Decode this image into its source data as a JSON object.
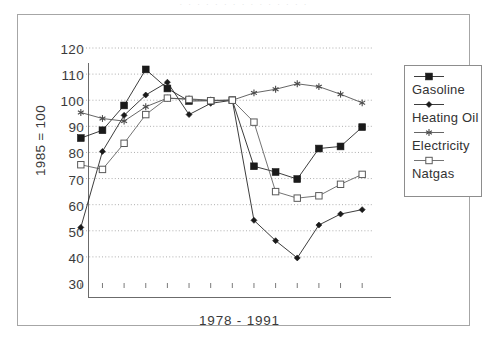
{
  "figure": {
    "scan_artifact_text": "· · · · · · · · · · · · · · ·"
  },
  "chart_data": {
    "type": "line",
    "title": "",
    "subtitle": "",
    "xlabel": "1978 - 1991",
    "ylabel": "1985 = 100",
    "x": [
      1978,
      1979,
      1980,
      1981,
      1982,
      1983,
      1984,
      1985,
      1986,
      1987,
      1988,
      1989,
      1990,
      1991
    ],
    "x_tick_labels": [
      "",
      "",
      "",
      "",
      "",
      "",
      "",
      "",
      "",
      "",
      "",
      "",
      "",
      ""
    ],
    "ylim": [
      30,
      120
    ],
    "y_ticks": [
      30,
      40,
      50,
      60,
      70,
      80,
      90,
      100,
      110,
      120
    ],
    "y_tick_labels": [
      "30",
      "40",
      "50",
      "60",
      "70",
      "80",
      "90",
      "100",
      "110",
      "120"
    ],
    "grid": "horizontal-dotted",
    "legend_position": "right-outside",
    "series": [
      {
        "name": "Gasoline",
        "marker": "filled-square",
        "color": "#1a1a1a",
        "values": [
          85.5,
          88.5,
          98.0,
          111.8,
          104.5,
          99.7,
          99.8,
          100.0,
          74.7,
          72.5,
          69.8,
          81.5,
          82.3,
          89.7
        ]
      },
      {
        "name": "Heating Oil",
        "marker": "filled-diamond",
        "color": "#1a1a1a",
        "values": [
          51.3,
          80.4,
          94.2,
          102.0,
          106.9,
          94.5,
          98.8,
          100.0,
          54.0,
          46.2,
          39.6,
          52.2,
          56.4,
          58.1
        ]
      },
      {
        "name": "Electricity",
        "marker": "star",
        "color": "#4a4a4a",
        "values": [
          95.3,
          93.0,
          92.0,
          97.5,
          100.8,
          100.5,
          100.0,
          100.0,
          102.8,
          104.2,
          106.3,
          105.2,
          102.3,
          99.0
        ]
      },
      {
        "name": "Natgas",
        "marker": "open-square",
        "color": "#5a5a5a",
        "values": [
          75.3,
          73.5,
          83.5,
          94.5,
          100.8,
          100.3,
          99.8,
          100.0,
          91.6,
          65.0,
          62.5,
          63.4,
          67.8,
          71.6
        ]
      }
    ]
  },
  "legend": {
    "entries": [
      {
        "label": "Gasoline"
      },
      {
        "label": "Heating Oil"
      },
      {
        "label": "Electricity"
      },
      {
        "label": "Natgas"
      }
    ]
  }
}
